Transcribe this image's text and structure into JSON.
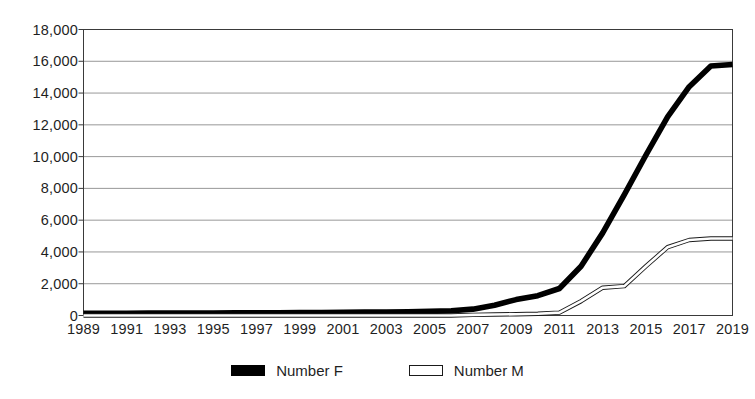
{
  "chart_data": {
    "type": "line",
    "title": "",
    "subtitle": "",
    "xlabel": "",
    "ylabel": "",
    "grid": true,
    "legend_position": "bottom",
    "xlim": [
      1989,
      2019
    ],
    "ylim": [
      0,
      18000
    ],
    "ytick_labels": [
      "18,000",
      "16,000",
      "14,000",
      "12,000",
      "10,000",
      "8,000",
      "6,000",
      "4,000",
      "2,000",
      "0"
    ],
    "ytick_values": [
      18000,
      16000,
      14000,
      12000,
      10000,
      8000,
      6000,
      4000,
      2000,
      0
    ],
    "xtick_labels": [
      "1989",
      "1991",
      "1993",
      "1995",
      "1997",
      "1999",
      "2001",
      "2003",
      "2005",
      "2007",
      "2009",
      "2011",
      "2013",
      "2015",
      "2017",
      "2019"
    ],
    "x": [
      1989,
      1990,
      1991,
      1992,
      1993,
      1994,
      1995,
      1996,
      1997,
      1998,
      1999,
      2000,
      2001,
      2002,
      2003,
      2004,
      2005,
      2006,
      2007,
      2008,
      2009,
      2010,
      2011,
      2012,
      2013,
      2014,
      2015,
      2016,
      2017,
      2018,
      2019
    ],
    "series": [
      {
        "name": "Number F",
        "color": "#000000",
        "style": "thick-solid",
        "values": [
          140,
          140,
          145,
          150,
          150,
          155,
          160,
          165,
          170,
          175,
          180,
          190,
          200,
          210,
          220,
          240,
          260,
          300,
          400,
          650,
          1000,
          1250,
          1700,
          3100,
          5200,
          7600,
          10100,
          12500,
          14400,
          15700,
          15800
        ]
      },
      {
        "name": "Number M",
        "color": "#ffffff",
        "outline": "#1a1a1a",
        "style": "thin-outlined",
        "values": [
          0,
          0,
          0,
          0,
          0,
          0,
          0,
          0,
          0,
          0,
          0,
          0,
          0,
          0,
          0,
          0,
          0,
          0,
          40,
          60,
          80,
          110,
          180,
          900,
          1750,
          1850,
          3100,
          4300,
          4750,
          4850,
          4850
        ]
      }
    ]
  },
  "legend": {
    "entries": [
      {
        "label": "Number F",
        "swatch": "solid-black"
      },
      {
        "label": "Number M",
        "swatch": "hollow-white"
      }
    ]
  }
}
